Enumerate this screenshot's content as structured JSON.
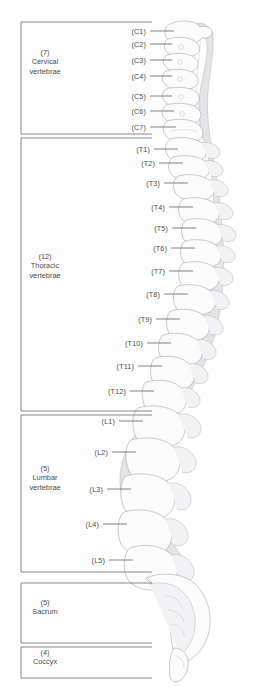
{
  "diagram": {
    "colors": {
      "background": "#fefefe",
      "text": "#4a4a4a",
      "line": "#5a5a5a",
      "bracket": "#6b6b6b",
      "bone_fill": "#fbfbfb",
      "bone_stroke": "#a8a8ac"
    }
  },
  "regions": [
    {
      "id": "cervical",
      "count": "(7)",
      "name_line1": "Cervical",
      "name_line2": "vertebrae",
      "top": 22,
      "bottom": 134,
      "label_cx": 45,
      "label_cy": 62
    },
    {
      "id": "thoracic",
      "count": "(12)",
      "name_line1": "Thoracic",
      "name_line2": "vertebrae",
      "top": 138,
      "bottom": 411,
      "label_cx": 45,
      "label_cy": 266
    },
    {
      "id": "lumbar",
      "count": "(5)",
      "name_line1": "Lumbar",
      "name_line2": "vertebrae",
      "top": 415,
      "bottom": 572,
      "label_cx": 45,
      "label_cy": 478
    },
    {
      "id": "sacrum",
      "count": "(5)",
      "name_line1": "Sacrum",
      "name_line2": "",
      "top": 583,
      "bottom": 643,
      "label_cx": 45,
      "label_cy": 607
    },
    {
      "id": "coccyx",
      "count": "(4)",
      "name_line1": "Coccyx",
      "name_line2": "",
      "top": 647,
      "bottom": 678,
      "label_cx": 45,
      "label_cy": 657
    }
  ],
  "vertebrae": [
    {
      "id": "C1",
      "label": "(C1)",
      "y": 31,
      "text_right": 146,
      "line_from": 150,
      "line_to": 174
    },
    {
      "id": "C2",
      "label": "(C2)",
      "y": 44,
      "text_right": 146,
      "line_from": 150,
      "line_to": 172
    },
    {
      "id": "C3",
      "label": "(C3)",
      "y": 60,
      "text_right": 146,
      "line_from": 150,
      "line_to": 172
    },
    {
      "id": "C4",
      "label": "(C4)",
      "y": 76,
      "text_right": 146,
      "line_from": 150,
      "line_to": 172
    },
    {
      "id": "C5",
      "label": "(C5)",
      "y": 96,
      "text_right": 146,
      "line_from": 150,
      "line_to": 172
    },
    {
      "id": "C6",
      "label": "(C6)",
      "y": 111,
      "text_right": 146,
      "line_from": 150,
      "line_to": 174
    },
    {
      "id": "C7",
      "label": "(C7)",
      "y": 127,
      "text_right": 146,
      "line_from": 150,
      "line_to": 176
    },
    {
      "id": "T1",
      "label": "(T1)",
      "y": 149,
      "text_right": 150,
      "line_from": 154,
      "line_to": 178
    },
    {
      "id": "T2",
      "label": "(T2)",
      "y": 163,
      "text_right": 155,
      "line_from": 159,
      "line_to": 183
    },
    {
      "id": "T3",
      "label": "(T3)",
      "y": 183,
      "text_right": 160,
      "line_from": 164,
      "line_to": 188
    },
    {
      "id": "T4",
      "label": "(T4)",
      "y": 207,
      "text_right": 165,
      "line_from": 169,
      "line_to": 193
    },
    {
      "id": "T5",
      "label": "(T5)",
      "y": 228,
      "text_right": 168,
      "line_from": 172,
      "line_to": 196
    },
    {
      "id": "T6",
      "label": "(T6)",
      "y": 248,
      "text_right": 167,
      "line_from": 171,
      "line_to": 195
    },
    {
      "id": "T7",
      "label": "(T7)",
      "y": 271,
      "text_right": 165,
      "line_from": 169,
      "line_to": 193
    },
    {
      "id": "T8",
      "label": "(T8)",
      "y": 294,
      "text_right": 160,
      "line_from": 164,
      "line_to": 188
    },
    {
      "id": "T9",
      "label": "(T9)",
      "y": 319,
      "text_right": 152,
      "line_from": 156,
      "line_to": 180
    },
    {
      "id": "T10",
      "label": "(T10)",
      "y": 343,
      "text_right": 143,
      "line_from": 147,
      "line_to": 171
    },
    {
      "id": "T11",
      "label": "(T11)",
      "y": 366,
      "text_right": 134,
      "line_from": 138,
      "line_to": 162
    },
    {
      "id": "T12",
      "label": "(T12)",
      "y": 391,
      "text_right": 126,
      "line_from": 130,
      "line_to": 154
    },
    {
      "id": "L1",
      "label": "(L1)",
      "y": 421,
      "text_right": 115,
      "line_from": 119,
      "line_to": 143
    },
    {
      "id": "L2",
      "label": "(L2)",
      "y": 452,
      "text_right": 108,
      "line_from": 112,
      "line_to": 136
    },
    {
      "id": "L3",
      "label": "(L3)",
      "y": 489,
      "text_right": 103,
      "line_from": 107,
      "line_to": 131
    },
    {
      "id": "L4",
      "label": "(L4)",
      "y": 524,
      "text_right": 99,
      "line_from": 103,
      "line_to": 127
    },
    {
      "id": "L5",
      "label": "(L5)",
      "y": 560,
      "text_right": 105,
      "line_from": 109,
      "line_to": 133
    }
  ]
}
